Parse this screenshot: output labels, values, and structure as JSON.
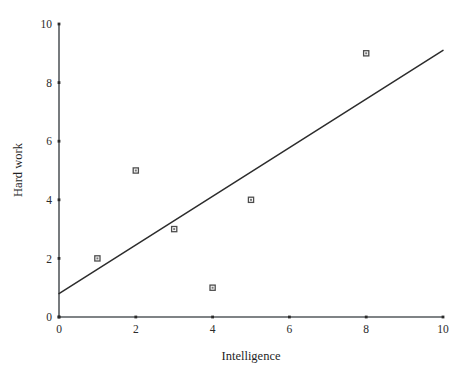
{
  "chart_data": {
    "type": "scatter",
    "title": "",
    "xlabel": "Intelligence",
    "ylabel": "Hard work",
    "xlim": [
      0,
      10
    ],
    "ylim": [
      0,
      10
    ],
    "xticks": [
      0,
      2,
      4,
      6,
      8,
      10
    ],
    "yticks": [
      0,
      2,
      4,
      6,
      8,
      10
    ],
    "xtick_labels": [
      "0",
      "2",
      "4",
      "6",
      "8",
      "10"
    ],
    "ytick_labels": [
      "0",
      "2",
      "4",
      "6",
      "8",
      "10"
    ],
    "grid": false,
    "legend": false,
    "marker": "open-square",
    "series": [
      {
        "name": "observations",
        "points": [
          {
            "x": 1,
            "y": 2
          },
          {
            "x": 2,
            "y": 5
          },
          {
            "x": 3,
            "y": 3
          },
          {
            "x": 4,
            "y": 1
          },
          {
            "x": 5,
            "y": 4
          },
          {
            "x": 8,
            "y": 9
          }
        ]
      }
    ],
    "trendline": {
      "name": "regression-line",
      "x_start": 0,
      "y_start": 0.8,
      "x_end": 10,
      "y_end": 9.1
    },
    "colors": {
      "axis": "#555a5e",
      "marker": "#4d4d4d",
      "line": "#2c2c2c",
      "text": "#1f1f1f",
      "background": "#ffffff"
    }
  }
}
